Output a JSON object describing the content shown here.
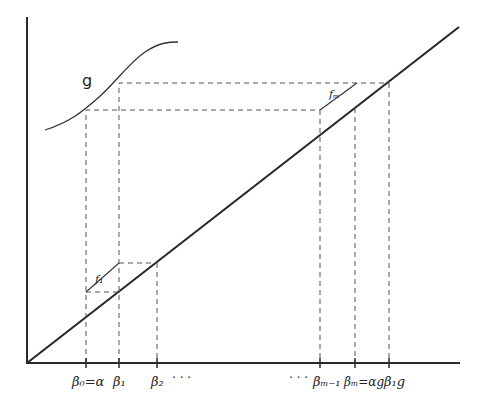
{
  "diagram": {
    "curve_label": "g",
    "segment_labels": {
      "f1": "f₁",
      "fm": "fₘ"
    },
    "x_tick_labels": [
      {
        "id": "beta0",
        "text": "β₀=α",
        "x": 86
      },
      {
        "id": "beta1",
        "text": "β₁",
        "x": 119
      },
      {
        "id": "beta2",
        "text": "β₂",
        "x": 157
      },
      {
        "id": "beta_m_minus_1",
        "text": "βₘ₋₁",
        "x": 320
      },
      {
        "id": "beta_m",
        "text": "βₘ=αg",
        "x": 355
      },
      {
        "id": "beta1g",
        "text": "β₁g",
        "x": 389
      }
    ],
    "ellipsis_left": "· · ·",
    "ellipsis_right": "· · ·"
  }
}
